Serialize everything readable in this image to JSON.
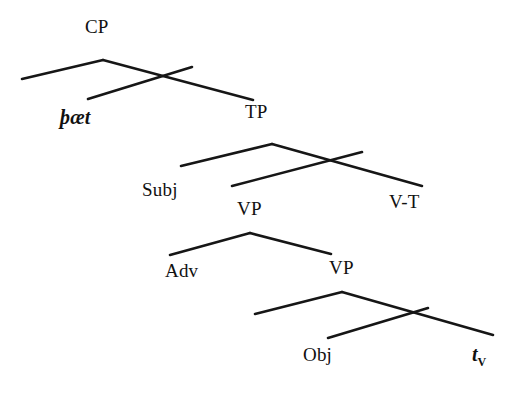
{
  "figure": {
    "kind": "syntax-tree-diagram",
    "background_color": "#ffffff",
    "line_color": "#161616"
  },
  "nodes": {
    "cp": "CP",
    "thaet": "þæt",
    "tp": "TP",
    "subj": "Subj",
    "v_t": "V-T",
    "vp_upper": "VP",
    "adv": "Adv",
    "vp_lower": "VP",
    "obj": "Obj",
    "trace_v_stem": "t",
    "trace_v_sub": "V"
  }
}
